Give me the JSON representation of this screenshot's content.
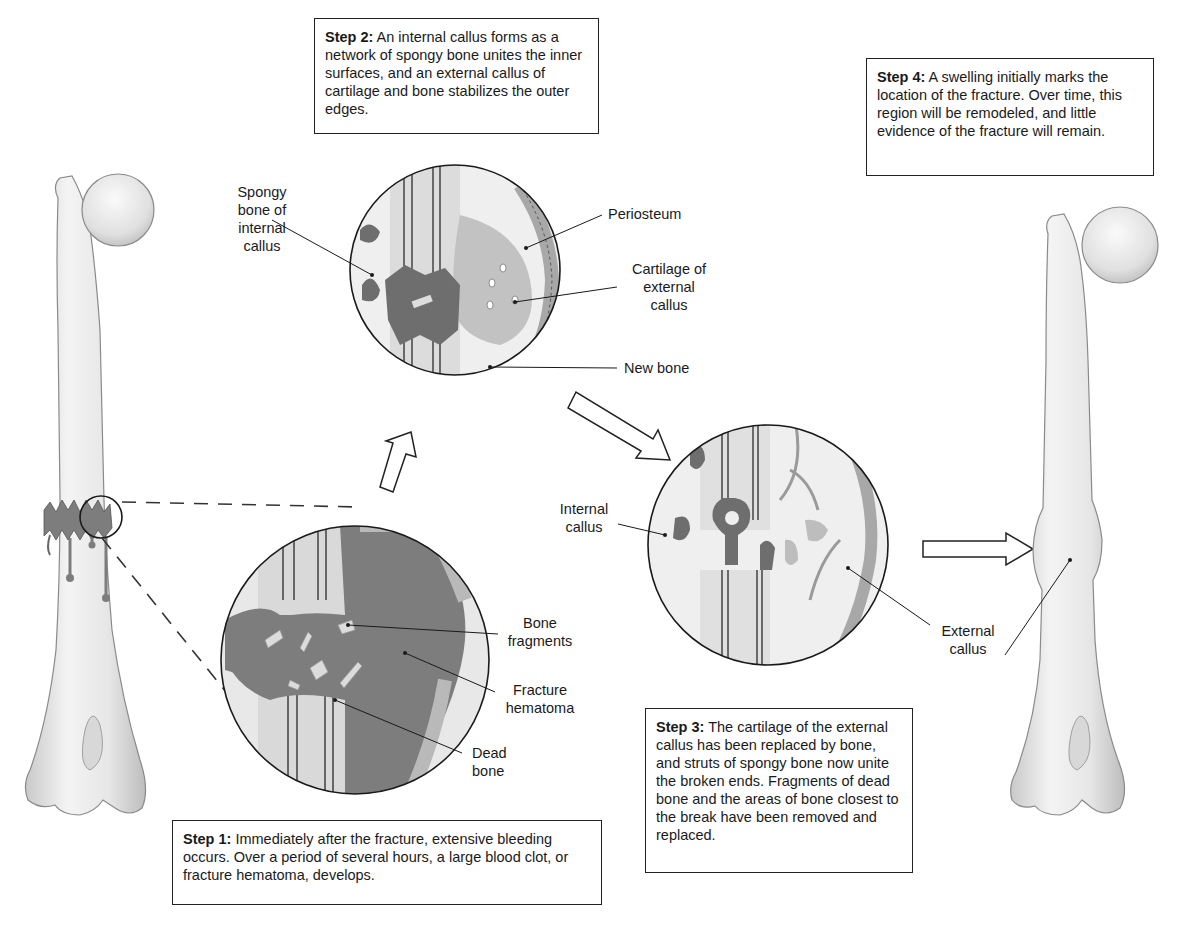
{
  "figure": {
    "colors": {
      "bone": "#ececec",
      "bone_shade": "#cfcfcf",
      "hematoma": "#7d7d7d",
      "callus_dark": "#6e6e6e",
      "cartilage": "#bdbdbd",
      "outline": "#1a1a1a",
      "background": "#ffffff"
    }
  },
  "steps": [
    {
      "id": 1,
      "heading": "Step 1:",
      "text": "Immediately after the fracture, extensive bleeding occurs. Over a period of several hours, a large blood clot, or fracture hematoma, develops."
    },
    {
      "id": 2,
      "heading": "Step 2:",
      "text": "An internal callus forms as a network of spongy bone unites the inner surfaces, and an external callus of cartilage and bone stabilizes the outer edges."
    },
    {
      "id": 3,
      "heading": "Step 3:",
      "text": "The cartilage of the external callus has been replaced by bone, and struts of spongy bone now unite the broken ends. Fragments of dead bone and the areas of bone closest to the break have been removed and replaced."
    },
    {
      "id": 4,
      "heading": "Step 4:",
      "text": "A swelling initially marks the location of the fracture. Over time, this region will be remodeled, and little evidence of the fracture will remain."
    }
  ],
  "labels": {
    "spongy_bone": [
      "Spongy",
      "bone of",
      "internal",
      "callus"
    ],
    "periosteum": [
      "Periosteum"
    ],
    "cartilage": [
      "Cartilage of",
      "external",
      "callus"
    ],
    "new_bone": [
      "New bone"
    ],
    "bone_fragments": [
      "Bone",
      "fragments"
    ],
    "fracture_hematoma": [
      "Fracture",
      "hematoma"
    ],
    "dead_bone": [
      "Dead",
      "bone"
    ],
    "internal_callus": [
      "Internal",
      "callus"
    ],
    "external_callus": [
      "External",
      "callus"
    ]
  }
}
